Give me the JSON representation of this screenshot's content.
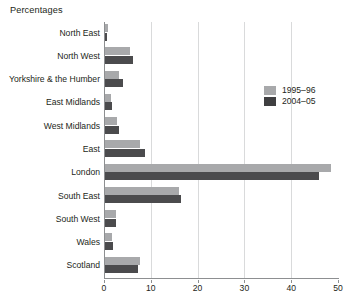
{
  "chart_data": {
    "type": "bar",
    "orientation": "horizontal",
    "title": "Percentages",
    "xlabel": "",
    "ylabel": "",
    "xlim": [
      0,
      50
    ],
    "xticks": [
      0,
      10,
      20,
      30,
      40,
      50
    ],
    "grid": "vertical",
    "legend_position": "right-upper",
    "categories": [
      "North East",
      "North West",
      "Yorkshire & the Humber",
      "East Midlands",
      "West Midlands",
      "East",
      "London",
      "South East",
      "South West",
      "Wales",
      "Scotland"
    ],
    "series": [
      {
        "name": "1995–96",
        "color": "#a8a9ab",
        "values": [
          0.9,
          5.5,
          3.3,
          1.6,
          2.8,
          7.7,
          48.5,
          16.0,
          2.5,
          1.8,
          7.7
        ]
      },
      {
        "name": "2004–05",
        "color": "#4b4b4d",
        "values": [
          0.7,
          6.2,
          4.0,
          1.8,
          3.2,
          8.8,
          46.0,
          16.5,
          2.5,
          1.9,
          7.2
        ]
      }
    ]
  },
  "colors": {
    "axis": "#8d8f91",
    "gridline": "#d9dadb",
    "text": "#231f20",
    "background": "#ffffff"
  }
}
